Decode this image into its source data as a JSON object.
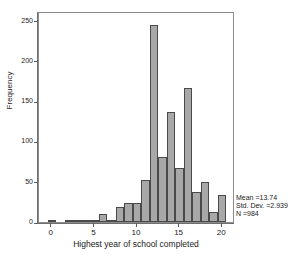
{
  "chart_data": {
    "type": "bar",
    "title": "",
    "xlabel": "Highest year of school completed",
    "ylabel": "Frequency",
    "xlim": [
      -1.5,
      21.5
    ],
    "ylim": [
      0,
      262
    ],
    "grid": false,
    "legend": null,
    "xticks": [
      "0",
      "5",
      "10",
      "15",
      "20"
    ],
    "xtick_values": [
      0,
      5,
      10,
      15,
      20
    ],
    "yticks": [
      "0",
      "50",
      "100",
      "150",
      "200",
      "250"
    ],
    "ytick_values": [
      0,
      50,
      100,
      150,
      200,
      250
    ],
    "categories": [
      0,
      1,
      2,
      3,
      4,
      5,
      6,
      7,
      8,
      9,
      10,
      11,
      12,
      13,
      14,
      15,
      16,
      17,
      18,
      19,
      20
    ],
    "values": [
      1,
      0,
      2,
      1,
      1,
      2,
      10,
      3,
      19,
      23,
      24,
      52,
      245,
      81,
      137,
      67,
      167,
      37,
      50,
      13,
      33
    ],
    "bar_color": "#a8a8a8",
    "bar_edge_color": "#4a4a4a"
  },
  "annotations": {
    "mean": "Mean =13.74",
    "std_dev": "Std. Dev. =2.939",
    "n": "N =984"
  }
}
